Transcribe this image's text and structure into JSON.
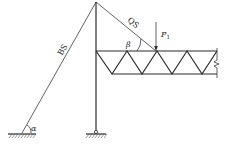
{
  "diagram": {
    "type": "structural-truss-cantilever",
    "labels": {
      "back_stay": "BS",
      "front_stay": "QS",
      "load": "P",
      "load_subscript": "1",
      "angle_base": "α",
      "angle_stay": "β"
    },
    "caption": "",
    "colors": {
      "stroke": "#2a2a2a",
      "background": "#ffffff"
    }
  }
}
